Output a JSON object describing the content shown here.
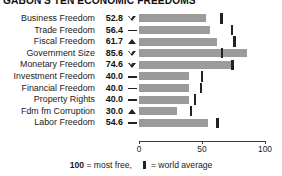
{
  "chart_data": {
    "type": "bar",
    "title": "GABON'S TEN ECONOMIC FREEDOMS",
    "xlabel": "",
    "ylabel": "",
    "xlim": [
      0,
      100
    ],
    "xticks": [
      0,
      50,
      100
    ],
    "xtick_labels": [
      "0",
      "50",
      "100"
    ],
    "grid": false,
    "legend_position": "bottom",
    "orientation": "horizontal",
    "bar_color": "#9b9b9b",
    "marker_color": "#222222",
    "categories": [
      "Business Freedom",
      "Trade Freedom",
      "Fiscal Freedom",
      "Government Size",
      "Monetary Freedom",
      "Investment Freedom",
      "Financial Freedom",
      "Property Rights",
      "Fdm fm Corruption",
      "Labor Freedom"
    ],
    "values": [
      52.8,
      56.4,
      61.7,
      85.6,
      74.6,
      40.0,
      40.0,
      40.0,
      30.0,
      54.6
    ],
    "value_labels": [
      "52.8",
      "56.4",
      "61.7",
      "85.6",
      "74.6",
      "40.0",
      "40.0",
      "40.0",
      "30.0",
      "54.6"
    ],
    "trends": [
      "down",
      "flat",
      "up",
      "down",
      "down",
      "flat",
      "flat",
      "flat",
      "up",
      "flat"
    ],
    "trend_glyphs": {
      "down": "triangle-down-outline",
      "up": "triangle-up-solid",
      "flat": "dash"
    },
    "world_average": [
      64.6,
      73.2,
      74.9,
      65.0,
      73.4,
      49.0,
      48.5,
      43.8,
      40.3,
      61.5
    ],
    "world_average_series_name": "world average"
  },
  "footer": {
    "most_free_value": "100",
    "most_free_text": "= most free,",
    "average_text": "= world average"
  }
}
